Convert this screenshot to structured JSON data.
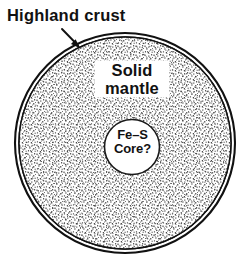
{
  "figure": {
    "type": "cross-section-diagram",
    "background_color": "#ffffff",
    "line_color": "#111111"
  },
  "labels": {
    "crust": {
      "word1": "Highland",
      "word2": "crust",
      "full": "Highland crust"
    },
    "mantle": {
      "line1": "Solid",
      "line2": "mantle",
      "full": "Solid mantle"
    },
    "core": {
      "line1": "Fe–S",
      "line2": "Core?",
      "full": "Fe–S Core?"
    }
  },
  "layers": [
    {
      "name": "highland-crust",
      "label": "Highland crust",
      "fill": "#ffffff",
      "stroke": "#111111",
      "outer_radius": 110,
      "inner_radius": 106
    },
    {
      "name": "solid-mantle",
      "label": "Solid mantle",
      "fill": "stipple",
      "stroke": "#111111",
      "outer_radius": 106,
      "inner_radius": 27.5
    },
    {
      "name": "fe-s-core",
      "label": "Fe–S Core?",
      "fill": "#ffffff",
      "stroke": "#111111",
      "outer_radius": 27.5,
      "inner_radius": 0
    }
  ],
  "geometry": {
    "body_center_x": 125,
    "body_center_y": 143,
    "body_radius": 110,
    "mantle_radius": 106,
    "core_center_x": 132,
    "core_center_y": 147,
    "core_radius": 27.5,
    "leader_from_x": 62,
    "leader_from_y": 29,
    "leader_to_x": 79,
    "leader_to_y": 47
  },
  "colors": {
    "ink": "#111111",
    "paper": "#ffffff",
    "stipple": "#3a3a3a"
  }
}
